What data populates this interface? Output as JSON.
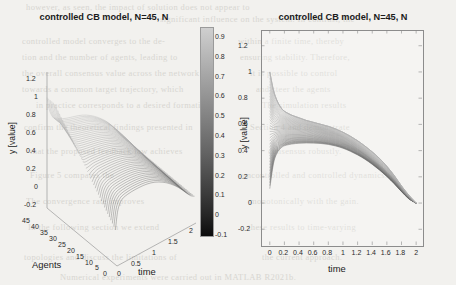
{
  "figure": {
    "background_color": "#f2f1ee",
    "ink_color": "#555555"
  },
  "bleed_through_text": [
    {
      "text": "however, as seen, the impact of solution does not appear to",
      "x": 26,
      "y": 2
    },
    {
      "text": "significant influence on the system. In contrast, the",
      "x": 160,
      "y": 14
    },
    {
      "text": "controlled model converges to the de-",
      "x": 22,
      "y": 36
    },
    {
      "text": "within a finite time, thereby",
      "x": 238,
      "y": 36
    },
    {
      "text": "tion and the number of agents, leading to",
      "x": 22,
      "y": 52
    },
    {
      "text": "ensuring stability. Therefore,",
      "x": 240,
      "y": 52
    },
    {
      "text": "the overall consensus value across the network",
      "x": 22,
      "y": 68
    },
    {
      "text": "it is possible to control",
      "x": 250,
      "y": 68
    },
    {
      "text": "towards a common target trajectory, which",
      "x": 22,
      "y": 84
    },
    {
      "text": "and steer the agents",
      "x": 256,
      "y": 84
    },
    {
      "text": "in practice corresponds to a desired formation.",
      "x": 36,
      "y": 100
    },
    {
      "text": "The simulation results",
      "x": 262,
      "y": 100
    },
    {
      "text": "confirm the theoretical findings presented in",
      "x": 24,
      "y": 122
    },
    {
      "text": "Section 4 and demonstrate",
      "x": 250,
      "y": 122
    },
    {
      "text": "that the proposed feedback law achieves",
      "x": 30,
      "y": 146
    },
    {
      "text": "consensus robustly.",
      "x": 268,
      "y": 146
    },
    {
      "text": "Figure 5 compares the",
      "x": 30,
      "y": 170
    },
    {
      "text": "uncontrolled and controlled dynamics.",
      "x": 242,
      "y": 170
    },
    {
      "text": "The convergence rate improves",
      "x": 26,
      "y": 196
    },
    {
      "text": "monotonically with the gain.",
      "x": 250,
      "y": 196
    },
    {
      "text": "In the following section we extend",
      "x": 28,
      "y": 222
    },
    {
      "text": "these results to time-varying",
      "x": 248,
      "y": 222
    },
    {
      "text": "topologies and discuss the limitations of",
      "x": 24,
      "y": 252
    },
    {
      "text": "the current approach.",
      "x": 262,
      "y": 252
    },
    {
      "text": "Numerical experiments were carried out in MATLAB R2021b.",
      "x": 60,
      "y": 272
    }
  ],
  "panel_left": {
    "name": "3d-surface-plot",
    "title": "controlled CB model, N=45, N",
    "y_axis": {
      "label": "y [value]",
      "ticks": [
        "1.2",
        "1",
        "0.8",
        "0.6",
        "0.4",
        "0.2",
        "0",
        "-0.2"
      ],
      "values": [
        1.2,
        1,
        0.8,
        0.6,
        0.4,
        0.2,
        0,
        -0.2
      ],
      "range": [
        -0.3,
        1.3
      ]
    },
    "agents_axis": {
      "label": "Agents",
      "ticks": [
        "45",
        "40",
        "35",
        "30",
        "25",
        "20",
        "15",
        "10",
        "5",
        "0"
      ],
      "values": [
        45,
        40,
        35,
        30,
        25,
        20,
        15,
        10,
        5,
        0
      ],
      "range": [
        0,
        45
      ]
    },
    "time_axis": {
      "label": "time",
      "ticks": [
        "0",
        "0.5",
        "1",
        "1.5",
        "2"
      ],
      "values": [
        0,
        0.5,
        1,
        1.5,
        2
      ],
      "range": [
        0,
        2
      ]
    }
  },
  "colorbar": {
    "name": "colorbar",
    "colormap": "gray",
    "orientation": "vertical",
    "ticks": [
      "0.9",
      "0.8",
      "0.7",
      "0.6",
      "0.5",
      "0.4",
      "0.3",
      "0.2",
      "0.1",
      "0",
      "-0.1"
    ],
    "values": [
      0.9,
      0.8,
      0.7,
      0.6,
      0.5,
      0.4,
      0.3,
      0.2,
      0.1,
      0,
      -0.1
    ],
    "range": [
      -0.1,
      0.95
    ],
    "top_color": "#cfcfcf",
    "bottom_color": "#0b0b0b"
  },
  "panel_right": {
    "name": "trajectory-plot",
    "title": "controlled CB model, N=45, N",
    "x_axis": {
      "label": "time",
      "ticks": [
        "0",
        "0.2",
        "0.4",
        "0.6",
        "0.8",
        "1",
        "1.2",
        "1.4",
        "1.6",
        "1.8",
        "2"
      ],
      "values": [
        0,
        0.2,
        0.4,
        0.6,
        0.8,
        1,
        1.2,
        1.4,
        1.6,
        1.8,
        2
      ],
      "range": [
        0,
        2
      ]
    },
    "y_axis": {
      "label": "y [value]",
      "ticks": [
        "1.2",
        "1",
        "0.8",
        "0.6",
        "0.4",
        "0.2",
        "0",
        "-0.2"
      ],
      "values": [
        1.2,
        1,
        0.8,
        0.6,
        0.4,
        0.2,
        0,
        -0.2
      ],
      "range": [
        -0.3,
        1.3
      ]
    }
  },
  "chart_data": {
    "type": "line",
    "title": "controlled CB model, N=45, N",
    "xlabel": "time",
    "ylabel": "y [value]",
    "xlim": [
      0,
      2
    ],
    "ylim": [
      -0.3,
      1.3
    ],
    "grid": false,
    "legend": "none",
    "n_series": 45,
    "x": [
      0,
      0.05,
      0.1,
      0.15,
      0.2,
      0.3,
      0.4,
      0.5,
      0.6,
      0.7,
      0.8,
      0.9,
      1.0,
      1.1,
      1.2,
      1.3,
      1.4,
      1.5,
      1.6,
      1.7,
      1.8,
      1.9,
      2.0
    ],
    "series": [
      {
        "name": "agent 45",
        "y0": 1.0,
        "values": [
          1.0,
          0.86,
          0.78,
          0.73,
          0.7,
          0.67,
          0.65,
          0.63,
          0.615,
          0.6,
          0.585,
          0.565,
          0.54,
          0.51,
          0.475,
          0.435,
          0.39,
          0.34,
          0.28,
          0.21,
          0.13,
          0.06,
          0.0
        ]
      },
      {
        "name": "agent 40",
        "y0": 0.89,
        "values": [
          0.89,
          0.78,
          0.72,
          0.685,
          0.665,
          0.645,
          0.63,
          0.615,
          0.6,
          0.585,
          0.57,
          0.55,
          0.525,
          0.495,
          0.46,
          0.42,
          0.375,
          0.325,
          0.27,
          0.2,
          0.125,
          0.055,
          0.0
        ]
      },
      {
        "name": "agent 35",
        "y0": 0.78,
        "values": [
          0.78,
          0.7,
          0.665,
          0.645,
          0.635,
          0.62,
          0.608,
          0.597,
          0.585,
          0.57,
          0.555,
          0.535,
          0.51,
          0.48,
          0.445,
          0.405,
          0.36,
          0.31,
          0.255,
          0.19,
          0.118,
          0.05,
          0.0
        ]
      },
      {
        "name": "agent 30",
        "y0": 0.67,
        "values": [
          0.67,
          0.625,
          0.61,
          0.605,
          0.6,
          0.592,
          0.584,
          0.575,
          0.565,
          0.553,
          0.538,
          0.52,
          0.495,
          0.465,
          0.43,
          0.39,
          0.345,
          0.295,
          0.24,
          0.178,
          0.11,
          0.046,
          0.0
        ]
      },
      {
        "name": "agent 25",
        "y0": 0.56,
        "values": [
          0.56,
          0.555,
          0.558,
          0.562,
          0.565,
          0.562,
          0.557,
          0.551,
          0.543,
          0.533,
          0.52,
          0.502,
          0.478,
          0.449,
          0.415,
          0.376,
          0.332,
          0.284,
          0.231,
          0.172,
          0.105,
          0.043,
          0.0
        ]
      },
      {
        "name": "agent 20",
        "y0": 0.44,
        "values": [
          0.44,
          0.485,
          0.508,
          0.519,
          0.525,
          0.527,
          0.526,
          0.523,
          0.518,
          0.51,
          0.499,
          0.483,
          0.461,
          0.434,
          0.402,
          0.365,
          0.322,
          0.275,
          0.223,
          0.165,
          0.1,
          0.04,
          0.0
        ]
      },
      {
        "name": "agent 15",
        "y0": 0.33,
        "values": [
          0.33,
          0.42,
          0.462,
          0.481,
          0.491,
          0.497,
          0.499,
          0.498,
          0.495,
          0.489,
          0.479,
          0.465,
          0.445,
          0.42,
          0.389,
          0.353,
          0.312,
          0.266,
          0.215,
          0.159,
          0.096,
          0.038,
          0.0
        ]
      },
      {
        "name": "agent 10",
        "y0": 0.22,
        "values": [
          0.22,
          0.357,
          0.419,
          0.447,
          0.461,
          0.471,
          0.475,
          0.476,
          0.474,
          0.469,
          0.461,
          0.448,
          0.43,
          0.406,
          0.377,
          0.343,
          0.303,
          0.258,
          0.208,
          0.153,
          0.091,
          0.035,
          0.0
        ]
      },
      {
        "name": "agent 5",
        "y0": 0.11,
        "values": [
          0.11,
          0.3,
          0.382,
          0.418,
          0.437,
          0.45,
          0.456,
          0.458,
          0.457,
          0.454,
          0.447,
          0.435,
          0.418,
          0.395,
          0.367,
          0.334,
          0.295,
          0.251,
          0.202,
          0.147,
          0.087,
          0.032,
          0.0
        ]
      },
      {
        "name": "agent 1",
        "y0": 0.0,
        "values": [
          0.0,
          0.245,
          0.348,
          0.393,
          0.416,
          0.432,
          0.44,
          0.443,
          0.443,
          0.44,
          0.434,
          0.423,
          0.407,
          0.385,
          0.358,
          0.326,
          0.288,
          0.245,
          0.196,
          0.142,
          0.083,
          0.03,
          0.0
        ]
      }
    ]
  }
}
